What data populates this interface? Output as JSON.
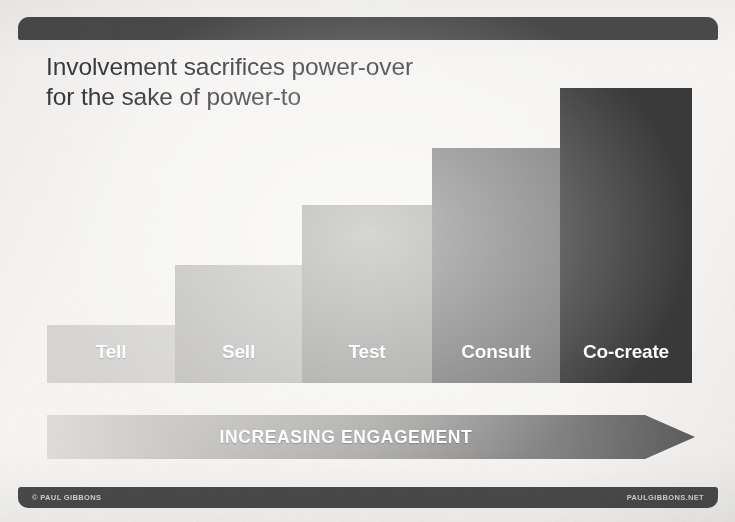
{
  "slide": {
    "background_color": "#f6f5f3",
    "header_bar_color": "#4a4a4c",
    "footer_bar_color": "#4a4a4c"
  },
  "title": {
    "line1": "Involvement sacrifices power-over",
    "line2": "for the sake of power-to",
    "color": "#3b3b3d"
  },
  "arrow": {
    "label": "INCREASING ENGAGEMENT",
    "gradient_start": "#dedddb",
    "gradient_end": "#5f5e5e"
  },
  "footer": {
    "copyright": "© PAUL GIBBONS",
    "website": "PAULGIBBONS.NET"
  },
  "chart_data": {
    "type": "bar",
    "title": "Involvement sacrifices power-over for the sake of power-to",
    "xlabel": "INCREASING ENGAGEMENT",
    "ylabel": "",
    "grid": false,
    "legend": "none",
    "axis_visible": false,
    "ylim": [
      0,
      300
    ],
    "categories": [
      "Tell",
      "Sell",
      "Test",
      "Consult",
      "Co-create"
    ],
    "values": [
      58,
      118,
      178,
      235,
      295
    ],
    "bars": [
      {
        "label": "Tell",
        "value": 58,
        "color": "#d6d5d3",
        "left": 47,
        "width": 128,
        "top": 325
      },
      {
        "label": "Sell",
        "value": 118,
        "color": "#c2c1bf",
        "left": 175,
        "width": 127,
        "top": 265
      },
      {
        "label": "Test",
        "value": 178,
        "color": "#a6a5a3",
        "left": 302,
        "width": 130,
        "top": 205
      },
      {
        "label": "Consult",
        "value": 235,
        "color": "#7c7b7b",
        "left": 432,
        "width": 128,
        "top": 148
      },
      {
        "label": "Co-create",
        "value": 295,
        "color": "#3a3a3a",
        "left": 560,
        "width": 132,
        "top": 88
      }
    ]
  }
}
